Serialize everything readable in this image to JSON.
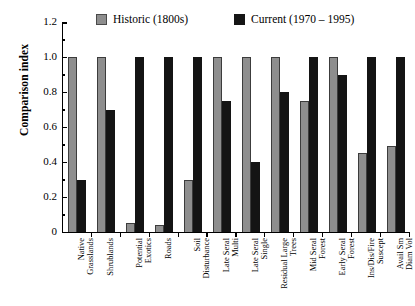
{
  "chart_data": {
    "type": "bar",
    "title": "",
    "xlabel": "",
    "ylabel": "Comparison index",
    "ylim": [
      0,
      1.2
    ],
    "ytick_labels": [
      "0",
      "0.2",
      "0.4",
      "0.6",
      "0.8",
      "1.0",
      "1.2"
    ],
    "ytick_values": [
      0,
      0.2,
      0.4,
      0.6,
      0.8,
      1.0,
      1.2
    ],
    "grid": false,
    "legend_position": "top-center",
    "categories": [
      [
        "Native",
        "Grasslands"
      ],
      [
        "Shrublands"
      ],
      [
        "Potential",
        "Exotics"
      ],
      [
        "Roads"
      ],
      [
        "Soil",
        "Disturbance"
      ],
      [
        "Late Seral",
        "Multi"
      ],
      [
        "Late Seral",
        "Single"
      ],
      [
        "Residual Large",
        "Trees"
      ],
      [
        "Mid Seral",
        "Forest"
      ],
      [
        "Early Seral",
        "Forest"
      ],
      [
        "Ins/Dis/Fire",
        "Suscept"
      ],
      [
        "Avail Sm",
        "Diam Vol"
      ]
    ],
    "series": [
      {
        "name": "Historic (1800s)",
        "color": "#8e8e8e",
        "values": [
          1.0,
          1.0,
          0.05,
          0.04,
          0.3,
          1.0,
          1.0,
          1.0,
          0.75,
          1.0,
          0.45,
          0.49
        ]
      },
      {
        "name": "Current (1970 – 1995)",
        "color": "#141414",
        "values": [
          0.3,
          0.7,
          1.0,
          1.0,
          1.0,
          0.75,
          0.4,
          0.8,
          1.0,
          0.9,
          1.0,
          1.0
        ]
      }
    ]
  }
}
